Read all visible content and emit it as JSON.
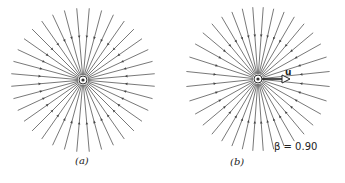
{
  "figure": {
    "panel_a": {
      "label": "(a)",
      "description": "Electric field lines of a charge at rest, uniform radial distribution",
      "center": [
        83,
        80
      ],
      "radius": 72,
      "line_count": 36,
      "arrow_direction": "inward"
    },
    "panel_b": {
      "label": "(b)",
      "description": "Electric field lines of a moving charge, compressed toward transverse plane",
      "center": [
        258,
        79
      ],
      "radius": 72,
      "line_count": 36,
      "arrow_direction": "inward",
      "velocity_label": "u",
      "beta_label": "β = 0.90",
      "beta": 0.9
    },
    "colors": {
      "line": "#555555",
      "arrow": "#444444",
      "text": "#222222"
    }
  }
}
